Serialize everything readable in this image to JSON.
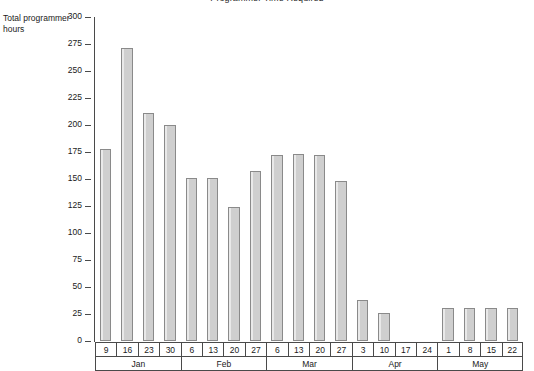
{
  "chart_data": {
    "type": "bar",
    "title": "Programmer Time Required",
    "ylabel": "Total programmer hours",
    "xlabel": "",
    "ylim": [
      0,
      300
    ],
    "ytick_step": 25,
    "yticks": [
      300,
      275,
      250,
      225,
      200,
      175,
      150,
      125,
      100,
      75,
      50,
      25,
      0
    ],
    "grid": false,
    "legend": null,
    "bar_color": "#cfcfcf",
    "bar_border_color": "#8a8a8a",
    "axis_color": "#4a4a4a",
    "categories": [
      "9",
      "16",
      "23",
      "30",
      "6",
      "13",
      "20",
      "27",
      "6",
      "13",
      "20",
      "27",
      "3",
      "10",
      "17",
      "24",
      "1",
      "8",
      "15",
      "22"
    ],
    "values": [
      178,
      271,
      211,
      200,
      151,
      151,
      124,
      157,
      172,
      173,
      172,
      148,
      38,
      26,
      0,
      0,
      31,
      31,
      31,
      31
    ],
    "month_groups": [
      {
        "label": "Jan",
        "span": 4
      },
      {
        "label": "Feb",
        "span": 4
      },
      {
        "label": "Mar",
        "span": 4
      },
      {
        "label": "Apr",
        "span": 4
      },
      {
        "label": "May",
        "span": 4
      }
    ]
  }
}
